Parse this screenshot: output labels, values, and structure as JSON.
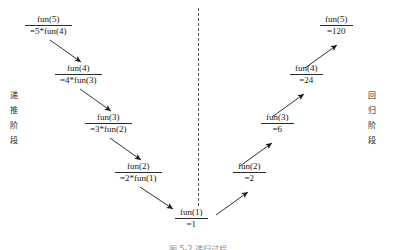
{
  "figure": {
    "title_caption": "图 5-2  递归过程",
    "phase_left": {
      "chars": [
        "递",
        "推",
        "阶",
        "段"
      ]
    },
    "phase_right": {
      "chars": [
        "回",
        "归",
        "阶",
        "段"
      ]
    },
    "divider": {
      "style": "dashed",
      "color": "#555555"
    },
    "ink_color": "#1a1a1a"
  },
  "descent_nodes": [
    {
      "numerator": "fun(5)",
      "denominator": "=5*fun(4)"
    },
    {
      "numerator": "fun(4)",
      "denominator": "=4*fun(3)"
    },
    {
      "numerator": "fun(3)",
      "denominator": "=3*fun(2)"
    },
    {
      "numerator": "fun(2)",
      "denominator": "=2*fun(1)"
    }
  ],
  "base_node": {
    "numerator": "fun(1)",
    "denominator": "=1"
  },
  "return_nodes": [
    {
      "numerator": "fun(2)",
      "denominator": "=2"
    },
    {
      "numerator": "fun(3)",
      "denominator": "=6"
    },
    {
      "numerator": "fun(4)",
      "denominator": "=24"
    },
    {
      "numerator": "fun(5)",
      "denominator": "=120"
    }
  ]
}
